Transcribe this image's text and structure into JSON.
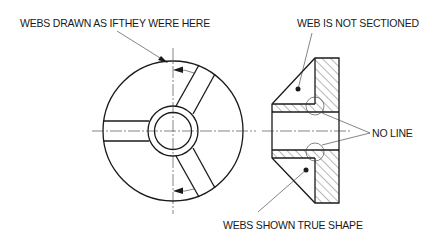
{
  "diagram": {
    "labels": {
      "webs_drawn": "WEBS DRAWN  AS IFTHEY WERE HERE",
      "web_not_sectioned": "WEB IS NOT SECTIONED",
      "no_line": "NO LINE",
      "webs_true_shape": "WEBS SHOWN TRUE SHAPE"
    },
    "views": [
      "end-view",
      "section-view"
    ],
    "colors": {
      "line": "#1a1a1a",
      "background": "#ffffff"
    }
  }
}
